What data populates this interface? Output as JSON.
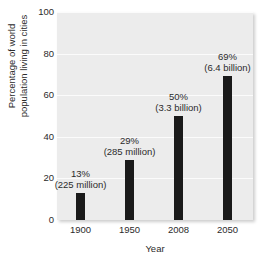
{
  "chart_data": {
    "type": "bar",
    "title": "",
    "xlabel": "Year",
    "ylabel_line1": "Percentage of world",
    "ylabel_line2": "population living in cities",
    "categories": [
      "1900",
      "1950",
      "2008",
      "2050"
    ],
    "values": [
      13,
      29,
      50,
      69
    ],
    "ylim": [
      0,
      100
    ],
    "yticks": [
      "0",
      "20",
      "40",
      "60",
      "80",
      "100"
    ],
    "ytick_values": [
      0,
      20,
      40,
      60,
      80,
      100
    ],
    "grid": true,
    "legend": "none",
    "bar_color": "#1a1a1a",
    "panel_color": "#ececec",
    "annotations": [
      {
        "pct": "13%",
        "abs": "(225 million)"
      },
      {
        "pct": "29%",
        "abs": "(285 million)"
      },
      {
        "pct": "50%",
        "abs": "(3.3 billion)"
      },
      {
        "pct": "69%",
        "abs": "(6.4 billion)"
      }
    ]
  }
}
